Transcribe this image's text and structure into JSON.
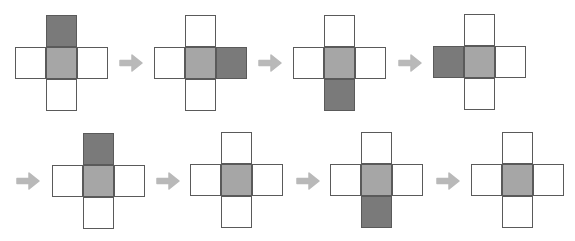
{
  "colors": {
    "center_fill": "#a6a6a6",
    "highlight_fill": "#7a7a7a",
    "empty_fill": "#ffffff",
    "border": "#5a5a5a",
    "arrow": "#b9b9b9"
  },
  "sequence": [
    {
      "step": 1,
      "highlighted": "top"
    },
    {
      "step": 2,
      "highlighted": "right"
    },
    {
      "step": 3,
      "highlighted": "bottom"
    },
    {
      "step": 4,
      "highlighted": "left"
    },
    {
      "step": 5,
      "highlighted": "top"
    },
    {
      "step": 6,
      "highlighted": "none"
    },
    {
      "step": 7,
      "highlighted": "bottom"
    },
    {
      "step": 8,
      "highlighted": "none"
    }
  ],
  "arrows_count": 7
}
